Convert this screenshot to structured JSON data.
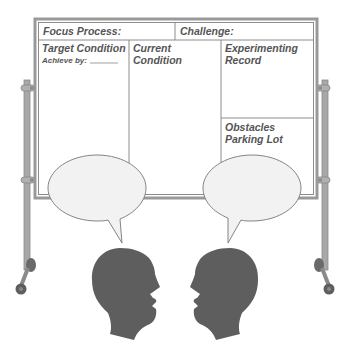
{
  "board": {
    "header": {
      "focus_process": "Focus Process:",
      "challenge": "Challenge:"
    },
    "columns": {
      "target_condition": {
        "title": "Target Condition",
        "subtitle": "Achieve by:",
        "blank": "_______"
      },
      "current_condition": {
        "line1": "Current",
        "line2": "Condition"
      },
      "experimenting_record": {
        "line1": "Experimenting",
        "line2": "Record"
      },
      "obstacles_parking_lot": {
        "line1": "Obstacles",
        "line2": "Parking Lot"
      }
    }
  },
  "figures": {
    "left_head": "person-silhouette-facing-right",
    "right_head": "person-silhouette-facing-left",
    "left_bubble": "speech-bubble",
    "right_bubble": "speech-bubble"
  },
  "colors": {
    "frame": "#8c8c8c",
    "frame_light": "#b5b5b5",
    "text": "#555555",
    "bubble_fill": "#f2f2f2",
    "bubble_stroke": "#777777",
    "head": "#5e5e5e",
    "wheel": "#6a6a6a"
  }
}
